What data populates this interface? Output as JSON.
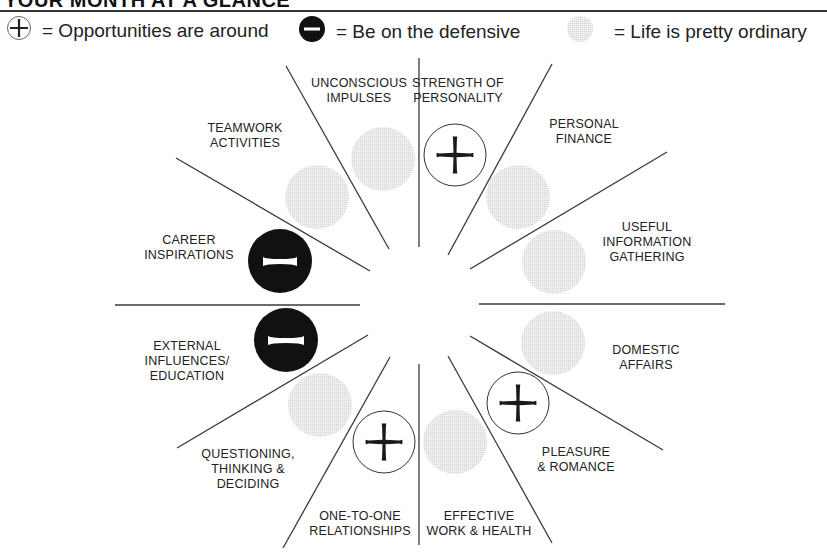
{
  "title": "YOUR MONTH AT A GLANCE",
  "legend": [
    {
      "symbol": "plus",
      "icon": "cross-in-circle-icon",
      "text": "= Opportunities are around"
    },
    {
      "symbol": "minus",
      "icon": "minus-in-black-circle-icon",
      "text": "= Be on the defensive"
    },
    {
      "symbol": "neutral",
      "icon": "gray-dotted-circle-icon",
      "text": "= Life is pretty ordinary"
    }
  ],
  "colors": {
    "line": "#3a3a3a",
    "negative_fill": "#111111",
    "neutral_fill": "#e6e6e6",
    "positive_stroke": "#333333"
  },
  "sections": [
    {
      "name": "strength-of-personality",
      "label": "STRENGTH OF\nPERSONALITY",
      "status": "plus"
    },
    {
      "name": "personal-finance",
      "label": "PERSONAL\nFINANCE",
      "status": "neutral"
    },
    {
      "name": "useful-information-gathering",
      "label": "USEFUL\nINFORMATION\nGATHERING",
      "status": "neutral"
    },
    {
      "name": "domestic-affairs",
      "label": "DOMESTIC\nAFFAIRS",
      "status": "neutral"
    },
    {
      "name": "pleasure-romance",
      "label": "PLEASURE\n& ROMANCE",
      "status": "plus"
    },
    {
      "name": "effective-work-health",
      "label": "EFFECTIVE\nWORK & HEALTH",
      "status": "neutral"
    },
    {
      "name": "one-to-one-relationships",
      "label": "ONE-TO-ONE\nRELATIONSHIPS",
      "status": "plus"
    },
    {
      "name": "questioning-thinking-deciding",
      "label": "QUESTIONING,\nTHINKING &\nDECIDING",
      "status": "neutral"
    },
    {
      "name": "external-influences-education",
      "label": "EXTERNAL\nINFLUENCES/\nEDUCATION",
      "status": "minus"
    },
    {
      "name": "career-inspirations",
      "label": "CAREER\nINSPIRATIONS",
      "status": "minus"
    },
    {
      "name": "teamwork-activities",
      "label": "TEAMWORK\nACTIVITIES",
      "status": "neutral"
    },
    {
      "name": "unconscious-impulses",
      "label": "UNCONSCIOUS\nIMPULSES",
      "status": "neutral"
    }
  ]
}
